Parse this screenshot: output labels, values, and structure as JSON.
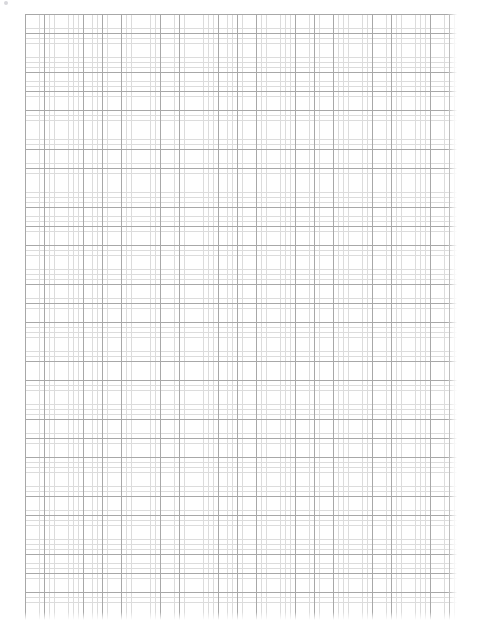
{
  "page": {
    "width": 482,
    "height": 637,
    "background_color": "#ffffff"
  },
  "header": {
    "left_text": "",
    "right_text": "",
    "glyph_icon": "dot-icon",
    "note": "faint cropped header row, text not legible"
  },
  "grid": {
    "label": "graph-paper-grid",
    "left": 25,
    "top": 14,
    "width": 432,
    "height": 606,
    "minor_spacing_px": 4.82,
    "major_spacing_px": 19.28,
    "minor_cells_per_major": 4,
    "minor_color": "#dcdcdc",
    "major_color": "#a8a8a8",
    "background_color": "#ffffff",
    "content": ""
  }
}
